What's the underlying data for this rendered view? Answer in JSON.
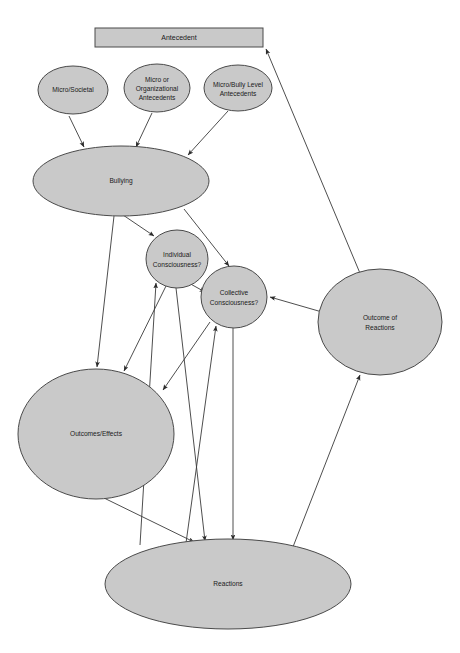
{
  "figure": {
    "caption": "",
    "background_color": "#ffffff",
    "node_fill_color": "#c9c9c9",
    "node_stroke_color": "#4a4a4a",
    "edge_color": "#3a3a3a",
    "label_color": "#1a1a1a"
  },
  "nodes": {
    "antecedent": {
      "label": "Antecedent",
      "shape": "rectangle",
      "x": 95,
      "y": 28,
      "width": 168,
      "height": 19
    },
    "micro_societal": {
      "label": "Micro/Societal",
      "shape": "ellipse",
      "cx": 73,
      "cy": 90,
      "rx": 35,
      "ry": 24
    },
    "micro_organizational": {
      "label_line1": "Micro or",
      "label_line2": "Organizational",
      "label_line3": "Antecedents",
      "shape": "ellipse",
      "cx": 157,
      "cy": 88,
      "rx": 33,
      "ry": 24
    },
    "micro_bully_level": {
      "label_line1": "Micro/Bully Level",
      "label_line2": "Antecedents",
      "shape": "ellipse",
      "cx": 238,
      "cy": 88,
      "rx": 34,
      "ry": 23
    },
    "bullying": {
      "label": "Bullying",
      "shape": "ellipse",
      "cx": 121,
      "cy": 181,
      "rx": 88,
      "ry": 35
    },
    "individual_consciousness": {
      "label_line1": "Individual",
      "label_line2": "Consciousness?",
      "shape": "ellipse",
      "cx": 177,
      "cy": 259,
      "rx": 31,
      "ry": 29
    },
    "collective_consciousness": {
      "label_line1": "Collective",
      "label_line2": "Consciousness?",
      "shape": "ellipse",
      "cx": 234,
      "cy": 297,
      "rx": 33,
      "ry": 31
    },
    "outcome_of_reactions": {
      "label_line1": "Outcome of",
      "label_line2": "Reactions",
      "shape": "ellipse",
      "cx": 380,
      "cy": 322,
      "rx": 62,
      "ry": 53
    },
    "outcomes_effects": {
      "label": "Outcomes/Effects",
      "shape": "ellipse",
      "cx": 96,
      "cy": 434,
      "rx": 78,
      "ry": 65
    },
    "reactions": {
      "label": "Reactions",
      "shape": "ellipse",
      "cx": 228,
      "cy": 584,
      "rx": 123,
      "ry": 45
    }
  },
  "edges": [
    {
      "from": "micro_societal",
      "to": "bullying",
      "arrow": "end"
    },
    {
      "from": "micro_organizational",
      "to": "bullying",
      "arrow": "end"
    },
    {
      "from": "micro_bully_level",
      "to": "bullying",
      "arrow": "end"
    },
    {
      "from": "bullying",
      "to": "individual_consciousness",
      "arrow": "end"
    },
    {
      "from": "bullying",
      "to": "collective_consciousness",
      "arrow": "end"
    },
    {
      "from": "bullying",
      "to": "outcomes_effects",
      "arrow": "end"
    },
    {
      "from": "individual_consciousness",
      "to": "collective_consciousness",
      "arrow": "end"
    },
    {
      "from": "individual_consciousness",
      "to": "outcomes_effects",
      "arrow": "end"
    },
    {
      "from": "individual_consciousness",
      "to": "reactions",
      "arrow": "end"
    },
    {
      "from": "collective_consciousness",
      "to": "reactions",
      "arrow": "end"
    },
    {
      "from": "reactions",
      "to": "individual_consciousness",
      "arrow": "end"
    },
    {
      "from": "reactions",
      "to": "collective_consciousness",
      "arrow": "end"
    },
    {
      "from": "reactions",
      "to": "outcome_of_reactions",
      "arrow": "end"
    },
    {
      "from": "outcome_of_reactions",
      "to": "collective_consciousness",
      "arrow": "end"
    },
    {
      "from": "outcome_of_reactions",
      "to": "antecedent",
      "arrow": "end"
    },
    {
      "from": "outcomes_effects",
      "to": "reactions",
      "arrow": "end"
    },
    {
      "from": "collective_consciousness",
      "to": "outcomes_effects",
      "arrow": "end"
    }
  ]
}
